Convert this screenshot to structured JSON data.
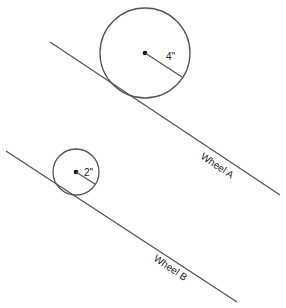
{
  "diagram": {
    "wheel_a": {
      "label": "Wheel A",
      "radius_label": "4\"",
      "center": [
        145,
        53
      ],
      "radius": 45,
      "ramp": {
        "x1": 50,
        "y1": 42,
        "x2": 280,
        "y2": 195
      },
      "label_pos": [
        214,
        160
      ],
      "radius_label_pos": [
        166,
        60
      ]
    },
    "wheel_b": {
      "label": "Wheel B",
      "radius_label": "2\"",
      "center": [
        76,
        172
      ],
      "radius": 23,
      "ramp": {
        "x1": 6,
        "y1": 151,
        "x2": 237,
        "y2": 302
      },
      "label_pos": [
        154,
        268
      ],
      "radius_label_pos": [
        85,
        177
      ]
    },
    "colors": {
      "line": "#555555",
      "dot": "#111111",
      "text": "#222222"
    }
  }
}
